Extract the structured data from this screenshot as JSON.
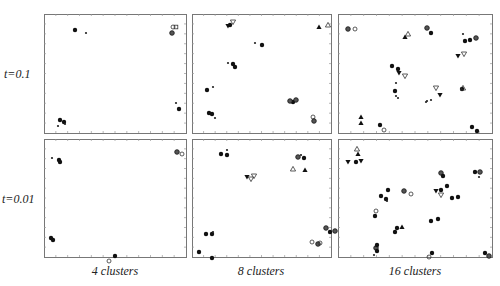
{
  "figure": {
    "row_labels": [
      "t=0.1",
      "t=0.01"
    ],
    "col_labels": [
      "4 clusters",
      "8 clusters",
      "16 clusters"
    ]
  },
  "chart_data": [
    {
      "type": "scatter",
      "row": "t=0.1",
      "col": "4 clusters",
      "panel": [
        44,
        14,
        186,
        133
      ],
      "points": [
        [
          75,
          30,
          "f"
        ],
        [
          86,
          33,
          "p"
        ],
        [
          173,
          27,
          "o"
        ],
        [
          176,
          27,
          "s"
        ],
        [
          172,
          33,
          "c"
        ],
        [
          176,
          103,
          "p"
        ],
        [
          179,
          109,
          "f"
        ],
        [
          60,
          120,
          "f"
        ],
        [
          64,
          122,
          "f"
        ],
        [
          58,
          126,
          "p"
        ],
        [
          65,
          124,
          "p"
        ]
      ]
    },
    {
      "type": "scatter",
      "row": "t=0.1",
      "col": "8 clusters",
      "panel": [
        192,
        14,
        331,
        133
      ],
      "points": [
        [
          228,
          26,
          "v"
        ],
        [
          230,
          25,
          "f"
        ],
        [
          233,
          22,
          "vo"
        ],
        [
          319,
          27,
          "t"
        ],
        [
          328,
          25,
          "to"
        ],
        [
          255,
          43,
          "p"
        ],
        [
          262,
          45,
          "f"
        ],
        [
          228,
          63,
          "p"
        ],
        [
          233,
          64,
          "f"
        ],
        [
          235,
          67,
          "f"
        ],
        [
          207,
          90,
          "f"
        ],
        [
          213,
          87,
          "p"
        ],
        [
          293,
          102,
          "f"
        ],
        [
          290,
          101,
          "c"
        ],
        [
          296,
          100,
          "c"
        ],
        [
          313,
          117,
          "o"
        ],
        [
          314,
          121,
          "c"
        ],
        [
          209,
          113,
          "f"
        ],
        [
          212,
          114,
          "f"
        ],
        [
          215,
          118,
          "p"
        ]
      ]
    },
    {
      "type": "scatter",
      "row": "t=0.1",
      "col": "16 clusters",
      "panel": [
        338,
        14,
        492,
        133
      ],
      "points": [
        [
          348,
          29,
          "c"
        ],
        [
          355,
          29,
          "o"
        ],
        [
          405,
          37,
          "t"
        ],
        [
          408,
          34,
          "to"
        ],
        [
          427,
          28,
          "c"
        ],
        [
          431,
          33,
          "f"
        ],
        [
          463,
          34,
          "p"
        ],
        [
          465,
          41,
          "f"
        ],
        [
          470,
          40,
          "f"
        ],
        [
          476,
          38,
          "c"
        ],
        [
          458,
          56,
          "v"
        ],
        [
          464,
          54,
          "vo"
        ],
        [
          392,
          66,
          "f"
        ],
        [
          398,
          69,
          "f"
        ],
        [
          399,
          73,
          "v"
        ],
        [
          405,
          76,
          "vo"
        ],
        [
          395,
          91,
          "f"
        ],
        [
          396,
          96,
          "p"
        ],
        [
          398,
          98,
          "p"
        ],
        [
          396,
          83,
          "p"
        ],
        [
          436,
          88,
          "vo"
        ],
        [
          440,
          95,
          "v"
        ],
        [
          426,
          102,
          "p"
        ],
        [
          431,
          100,
          "p"
        ],
        [
          462,
          89,
          "f"
        ],
        [
          463,
          88,
          "to"
        ],
        [
          427,
          101,
          "p"
        ],
        [
          361,
          117,
          "t"
        ],
        [
          361,
          123,
          "t"
        ],
        [
          380,
          125,
          "f"
        ],
        [
          384,
          130,
          "o"
        ],
        [
          472,
          127,
          "f"
        ],
        [
          477,
          131,
          "f"
        ]
      ]
    },
    {
      "type": "scatter",
      "row": "t=0.01",
      "col": "4 clusters",
      "panel": [
        44,
        139,
        186,
        257
      ],
      "points": [
        [
          52,
          158,
          "p"
        ],
        [
          59,
          160,
          "f"
        ],
        [
          60,
          162,
          "f"
        ],
        [
          177,
          152,
          "c"
        ],
        [
          182,
          154,
          "o"
        ],
        [
          51,
          238,
          "f"
        ],
        [
          53,
          240,
          "f"
        ],
        [
          115,
          256,
          "f"
        ],
        [
          109,
          261,
          "o"
        ]
      ]
    },
    {
      "type": "scatter",
      "row": "t=0.01",
      "col": "8 clusters",
      "panel": [
        192,
        139,
        331,
        257
      ],
      "points": [
        [
          221,
          154,
          "f"
        ],
        [
          227,
          155,
          "f"
        ],
        [
          227,
          150,
          "p"
        ],
        [
          247,
          177,
          "v"
        ],
        [
          251,
          179,
          "vo"
        ],
        [
          254,
          176,
          "vo"
        ],
        [
          293,
          169,
          "to"
        ],
        [
          305,
          170,
          "t"
        ],
        [
          298,
          157,
          "c"
        ],
        [
          301,
          155,
          "p"
        ],
        [
          304,
          158,
          "f"
        ],
        [
          206,
          234,
          "f"
        ],
        [
          212,
          234,
          "f"
        ],
        [
          213,
          232,
          "p"
        ],
        [
          199,
          252,
          "f"
        ],
        [
          212,
          258,
          "f"
        ],
        [
          326,
          228,
          "c"
        ],
        [
          330,
          232,
          "f"
        ],
        [
          335,
          231,
          "c"
        ],
        [
          312,
          242,
          "o"
        ],
        [
          318,
          244,
          "c"
        ],
        [
          320,
          243,
          "o"
        ]
      ]
    },
    {
      "type": "scatter",
      "row": "t=0.01",
      "col": "16 clusters",
      "panel": [
        338,
        139,
        492,
        257
      ],
      "points": [
        [
          357,
          149,
          "to"
        ],
        [
          358,
          154,
          "t"
        ],
        [
          348,
          162,
          "v"
        ],
        [
          356,
          162,
          "f"
        ],
        [
          361,
          161,
          "v"
        ],
        [
          381,
          196,
          "f"
        ],
        [
          386,
          199,
          "f"
        ],
        [
          387,
          201,
          "p"
        ],
        [
          388,
          190,
          "f"
        ],
        [
          404,
          191,
          "c"
        ],
        [
          411,
          194,
          "o"
        ],
        [
          441,
          195,
          "vo"
        ],
        [
          436,
          191,
          "v"
        ],
        [
          441,
          190,
          "f"
        ],
        [
          447,
          186,
          "f"
        ],
        [
          452,
          198,
          "f"
        ],
        [
          458,
          197,
          "f"
        ],
        [
          441,
          173,
          "c"
        ],
        [
          443,
          176,
          "f"
        ],
        [
          475,
          172,
          "f"
        ],
        [
          480,
          172,
          "c"
        ],
        [
          479,
          177,
          "p"
        ],
        [
          375,
          216,
          "f"
        ],
        [
          376,
          211,
          "o"
        ],
        [
          397,
          228,
          "f"
        ],
        [
          402,
          227,
          "t"
        ],
        [
          395,
          232,
          "f"
        ],
        [
          431,
          221,
          "f"
        ],
        [
          438,
          219,
          "f"
        ],
        [
          376,
          248,
          "c"
        ],
        [
          377,
          251,
          "f"
        ],
        [
          377,
          245,
          "f"
        ],
        [
          374,
          255,
          "p"
        ],
        [
          432,
          253,
          "f"
        ],
        [
          429,
          257,
          "o"
        ],
        [
          485,
          253,
          "f"
        ],
        [
          489,
          256,
          "c"
        ]
      ]
    }
  ]
}
